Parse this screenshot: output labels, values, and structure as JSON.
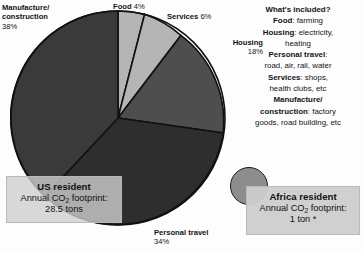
{
  "chart_data": {
    "type": "pie",
    "title": "",
    "categories": [
      "Food",
      "Services",
      "Housing",
      "Personal travel",
      "Manufacture/construction"
    ],
    "values": [
      4,
      6,
      18,
      34,
      38
    ],
    "unit": "%",
    "start_angle_deg": 0,
    "direction": "clockwise",
    "legend": "none",
    "slice_colors": [
      "#b5b5b5",
      "#b5b5b5",
      "#4e4e4e",
      "#2e2e2e",
      "#3a3a3a"
    ],
    "slice_stroke": "#111111",
    "labels": [
      {
        "name": "Food",
        "percent": "4%"
      },
      {
        "name": "Services",
        "percent": "6%"
      },
      {
        "name": "Housing",
        "percent": "18%"
      },
      {
        "name": "Personal travel",
        "percent": "34%"
      },
      {
        "name": "Manufacture/ construction",
        "percent": "38%"
      }
    ],
    "annotations": [
      "US resident Annual CO2 footprint: 28.5 tons",
      "Africa resident Annual CO2 footprint: 1 ton *"
    ]
  },
  "pie_labels": {
    "manufacture": {
      "line1": "Manufacture/",
      "line2": "construction",
      "percent": "38%"
    },
    "food": {
      "name": "Food",
      "percent": "4%"
    },
    "services": {
      "name": "Services",
      "percent": "6%"
    },
    "housing": {
      "name": "Housing",
      "percent": "18%"
    },
    "personal": {
      "name": "Personal travel",
      "percent": "34%"
    }
  },
  "callouts": {
    "us": {
      "heading": "US resident",
      "line1_pre": "Annual CO",
      "line1_sub": "2",
      "line1_post": " footprint:",
      "line2": "28.5 tons"
    },
    "africa": {
      "heading": "Africa resident",
      "line1_pre": "Annual CO",
      "line1_sub": "2",
      "line1_post": " footprint:",
      "line2": "1 ton *"
    }
  },
  "included": {
    "title": "What's included?",
    "rows": [
      {
        "key": "Food",
        "value": ": farming"
      },
      {
        "key": "Housing",
        "value": ": electricity,"
      },
      {
        "key": "",
        "value": "heating"
      },
      {
        "key": "Personal travel",
        "value": ":"
      },
      {
        "key": "",
        "value": "road, air, rail, water"
      },
      {
        "key": "Services",
        "value": ": shops,"
      },
      {
        "key": "",
        "value": "health clubs, etc"
      },
      {
        "key": "Manufacture/",
        "value": ""
      },
      {
        "key": "construction",
        "value": ": factory"
      },
      {
        "key": "",
        "value": "goods, road building, etc"
      }
    ]
  },
  "colors": {
    "background": "#fdfdfd",
    "text": "#141414",
    "callout_bg": "#cecece",
    "callout_border": "#b9b9b9",
    "africa_circle": "#8d8d8d"
  }
}
